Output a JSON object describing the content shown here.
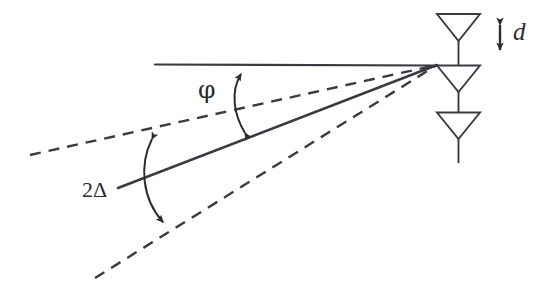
{
  "figure": {
    "stroke_color": "#3a3a42",
    "background_color": "#ffffff"
  },
  "labels": {
    "phi": "φ",
    "two_delta": "2Δ",
    "spacing": "d"
  },
  "geometry": {
    "convergence_point": {
      "x": 437,
      "y": 65
    },
    "reference_line": {
      "x1": 155,
      "y1": 64,
      "x2": 437,
      "y2": 65
    },
    "upper_dashed_ray": {
      "x1": 30,
      "y1": 155,
      "x2": 437,
      "y2": 65
    },
    "solid_beam_ray": {
      "x1": 118,
      "y1": 188,
      "x2": 437,
      "y2": 65
    },
    "lower_dashed_ray": {
      "x1": 95,
      "y1": 278,
      "x2": 437,
      "y2": 65
    },
    "phi_arc": {
      "from": {
        "x": 243,
        "y": 137
      },
      "to": {
        "x": 262,
        "y": 64
      }
    },
    "two_delta_arc": {
      "from": {
        "x": 148,
        "y": 133
      },
      "to": {
        "x": 168,
        "y": 228
      }
    },
    "spacing_arrow": {
      "x": 500,
      "y1": 17,
      "y2": 58
    }
  },
  "antennas": [
    {
      "name": "antenna-element-top",
      "top_y": 13,
      "left_x": 437,
      "right_x": 480,
      "apex_y": 40,
      "stem_end_y": 65
    },
    {
      "name": "antenna-element-middle",
      "top_y": 65,
      "left_x": 437,
      "right_x": 480,
      "apex_y": 92,
      "stem_end_y": 112
    },
    {
      "name": "antenna-element-bottom",
      "top_y": 112,
      "left_x": 437,
      "right_x": 480,
      "apex_y": 139,
      "stem_end_y": 163
    }
  ]
}
